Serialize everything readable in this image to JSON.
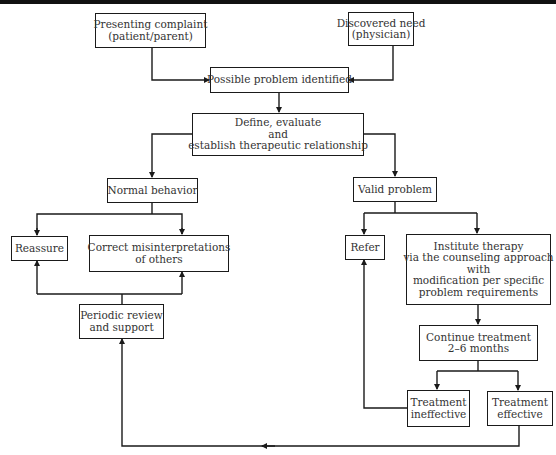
{
  "diagram": {
    "type": "flowchart",
    "nodes": {
      "presenting_complaint": {
        "lines": [
          "Presenting complaint",
          "(patient/parent)"
        ]
      },
      "discovered_need": {
        "lines": [
          "Discovered need",
          "(physician)"
        ]
      },
      "possible_problem": {
        "lines": [
          "Possible problem identified"
        ]
      },
      "define_evaluate": {
        "lines": [
          "Define, evaluate",
          "and",
          "establish therapeutic relationship"
        ]
      },
      "normal_behavior": {
        "lines": [
          "Normal behavior"
        ]
      },
      "valid_problem": {
        "lines": [
          "Valid problem"
        ]
      },
      "reassure": {
        "lines": [
          "Reassure"
        ]
      },
      "correct_misinterpretations": {
        "lines": [
          "Correct misinterpretations",
          "of others"
        ]
      },
      "periodic_review": {
        "lines": [
          "Periodic review",
          "and support"
        ]
      },
      "refer": {
        "lines": [
          "Refer"
        ]
      },
      "institute_therapy": {
        "lines": [
          "Institute therapy",
          "via the counseling approach",
          "with",
          "modification per specific",
          "problem requirements"
        ]
      },
      "continue_treatment": {
        "lines": [
          "Continue treatment",
          "2–6 months"
        ]
      },
      "treatment_ineffective": {
        "lines": [
          "Treatment",
          "ineffective"
        ]
      },
      "treatment_effective": {
        "lines": [
          "Treatment",
          "effective"
        ]
      }
    },
    "edges": [
      [
        "presenting_complaint",
        "possible_problem"
      ],
      [
        "discovered_need",
        "possible_problem"
      ],
      [
        "possible_problem",
        "define_evaluate"
      ],
      [
        "define_evaluate",
        "normal_behavior"
      ],
      [
        "define_evaluate",
        "valid_problem"
      ],
      [
        "normal_behavior",
        "reassure"
      ],
      [
        "normal_behavior",
        "correct_misinterpretations"
      ],
      [
        "periodic_review",
        "reassure"
      ],
      [
        "periodic_review",
        "correct_misinterpretations"
      ],
      [
        "valid_problem",
        "refer"
      ],
      [
        "valid_problem",
        "institute_therapy"
      ],
      [
        "institute_therapy",
        "continue_treatment"
      ],
      [
        "continue_treatment",
        "treatment_ineffective"
      ],
      [
        "continue_treatment",
        "treatment_effective"
      ],
      [
        "treatment_ineffective",
        "refer"
      ],
      [
        "treatment_effective",
        "periodic_review"
      ]
    ]
  }
}
